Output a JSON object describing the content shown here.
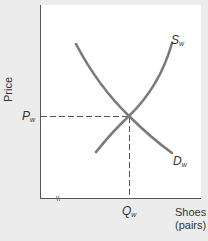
{
  "diagram": {
    "y_axis_label": "Price",
    "x_axis_label_line1": "Shoes",
    "x_axis_label_line2": "(pairs)",
    "price_label": {
      "main": "P",
      "sub": "w"
    },
    "quantity_label": {
      "main": "Q",
      "sub": "w"
    },
    "supply_label": {
      "main": "S",
      "sub": "w"
    },
    "demand_label": {
      "main": "D",
      "sub": "w"
    },
    "axis_break_mark": "//",
    "curves": [
      {
        "name": "Supply (world)",
        "label": "Sw",
        "direction": "upward-sloping"
      },
      {
        "name": "Demand (world)",
        "label": "Dw",
        "direction": "downward-sloping"
      }
    ],
    "equilibrium": {
      "price": "Pw",
      "quantity": "Qw"
    },
    "colors": {
      "background": "#ececec",
      "plot_area": "#ffffff",
      "axis": "#555555",
      "curve": "#7a7a7a",
      "dashed": "#555555",
      "text": "#333333"
    }
  }
}
